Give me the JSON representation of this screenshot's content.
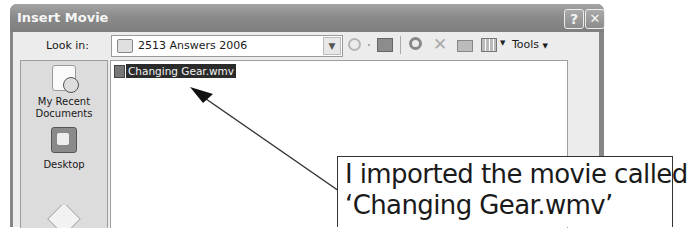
{
  "window": {
    "title": "Insert Movie",
    "help_button": "?",
    "close_button": "✕"
  },
  "toolbar": {
    "look_in_label": "Look in:",
    "look_in_value": "2513 Answers 2006",
    "look_in_dropdown_icon": "chevron-down",
    "icons": [
      "back-icon",
      "up-folder-icon",
      "search-web-icon",
      "delete-icon",
      "new-folder-icon",
      "views-icon"
    ],
    "tools_label": "Tools"
  },
  "places_bar": {
    "items": [
      {
        "label_line1": "My Recent",
        "label_line2": "Documents",
        "icon": "recent-documents-icon"
      },
      {
        "label_line1": "Desktop",
        "label_line2": "",
        "icon": "desktop-icon"
      },
      {
        "label_line1": "",
        "label_line2": "",
        "icon": "my-documents-icon"
      }
    ]
  },
  "file_list": {
    "items": [
      {
        "name": "Changing Gear.wmv",
        "selected": true,
        "icon": "video-file-icon"
      }
    ]
  },
  "callout": {
    "line1": "I imported the movie called",
    "line2": "‘Changing Gear.wmv’"
  },
  "colors": {
    "titlebar": "#888888",
    "selection": "#2b2b2b",
    "dialog_bg": "#ececec"
  }
}
